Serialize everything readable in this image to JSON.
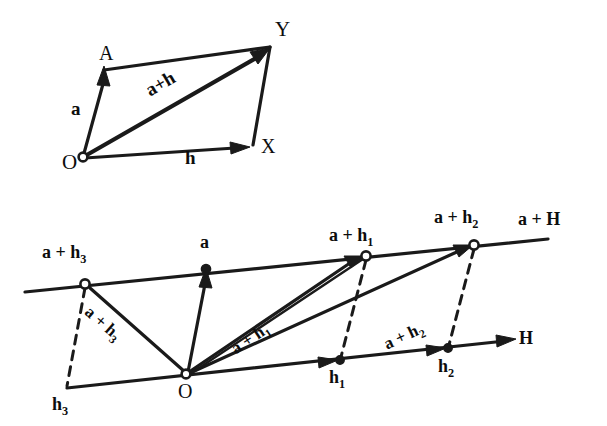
{
  "figure": {
    "background_color": "#ffffff",
    "ink_color": "#1a1a1a",
    "width": 607,
    "height": 426,
    "type": "vector-geometry-diagram"
  },
  "top_diagram": {
    "name": "parallelogram-law",
    "labels": {
      "origin": "O",
      "vertex_a": "A",
      "vertex_y": "Y",
      "vertex_x": "X",
      "vector_a": "a",
      "vector_h": "h",
      "vector_sum": "a+h"
    },
    "points": {
      "O": [
        83,
        157
      ],
      "A": [
        106,
        70
      ],
      "Y": [
        270,
        47
      ],
      "X": [
        253,
        144
      ]
    }
  },
  "bottom_diagram": {
    "name": "affine-translate",
    "labels": {
      "origin": "O",
      "vector_a": "a",
      "upper_line_end": "a + H",
      "lower_line_end": "H",
      "node_a_h1_prefix": "a + h",
      "node_a_h1_sub": "1",
      "node_a_h2_prefix": "a + h",
      "node_a_h2_sub": "2",
      "node_a_h3_prefix": "a + h",
      "node_a_h3_sub": "3",
      "ray_a_h1_prefix": "a + h",
      "ray_a_h1_sub": "1",
      "ray_a_h2_prefix": "a + h",
      "ray_a_h2_sub": "2",
      "ray_a_h3_prefix": "a + h",
      "ray_a_h3_sub": "3",
      "node_h1_prefix": "h",
      "node_h1_sub": "1",
      "node_h2_prefix": "h",
      "node_h2_sub": "2",
      "node_h3_prefix": "h",
      "node_h3_sub": "3"
    },
    "points": {
      "O": [
        186,
        374
      ],
      "a": [
        206,
        270
      ],
      "a_plus_h1": [
        366,
        256
      ],
      "a_plus_h2": [
        474,
        245
      ],
      "a_plus_h3": [
        85,
        284
      ],
      "h1": [
        340,
        360
      ],
      "h2": [
        448,
        348
      ],
      "h3": [
        67,
        388
      ],
      "upper_line_left": [
        25,
        292
      ],
      "upper_line_right": [
        548,
        239
      ],
      "lower_line_right": [
        512,
        340
      ]
    }
  }
}
